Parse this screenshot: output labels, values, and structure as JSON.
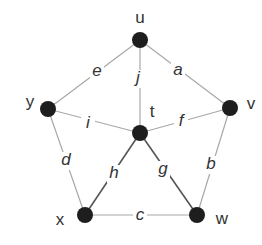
{
  "graph": {
    "nodes": [
      {
        "id": "u",
        "label": "u",
        "x": 140,
        "y": 40,
        "lx": 140,
        "ly": 19
      },
      {
        "id": "v",
        "label": "v",
        "x": 230,
        "y": 108,
        "lx": 251,
        "ly": 105
      },
      {
        "id": "w",
        "label": "w",
        "x": 197,
        "y": 215,
        "lx": 222,
        "ly": 220
      },
      {
        "id": "x",
        "label": "x",
        "x": 85,
        "y": 215,
        "lx": 60,
        "ly": 221
      },
      {
        "id": "y",
        "label": "y",
        "x": 48,
        "y": 109,
        "lx": 30,
        "ly": 103
      },
      {
        "id": "t",
        "label": "t",
        "x": 140,
        "y": 133,
        "lx": 152,
        "ly": 113
      }
    ],
    "edges": [
      {
        "id": "a",
        "label": "a",
        "from": "u",
        "to": "v",
        "lx": 178,
        "ly": 71
      },
      {
        "id": "b",
        "label": "b",
        "from": "v",
        "to": "w",
        "lx": 211,
        "ly": 165
      },
      {
        "id": "c",
        "label": "c",
        "from": "x",
        "to": "w",
        "lx": 140,
        "ly": 216
      },
      {
        "id": "d",
        "label": "d",
        "from": "y",
        "to": "x",
        "lx": 66,
        "ly": 161
      },
      {
        "id": "e",
        "label": "e",
        "from": "u",
        "to": "y",
        "lx": 97,
        "ly": 72
      },
      {
        "id": "f",
        "label": "f",
        "from": "t",
        "to": "v",
        "lx": 181,
        "ly": 122
      },
      {
        "id": "g",
        "label": "g",
        "from": "t",
        "to": "w",
        "lx": 163,
        "ly": 170
      },
      {
        "id": "h",
        "label": "h",
        "from": "t",
        "to": "x",
        "lx": 114,
        "ly": 174
      },
      {
        "id": "i",
        "label": "i",
        "from": "t",
        "to": "y",
        "lx": 88,
        "ly": 124
      },
      {
        "id": "j",
        "label": "j",
        "from": "u",
        "to": "t",
        "lx": 138,
        "ly": 79
      }
    ]
  }
}
